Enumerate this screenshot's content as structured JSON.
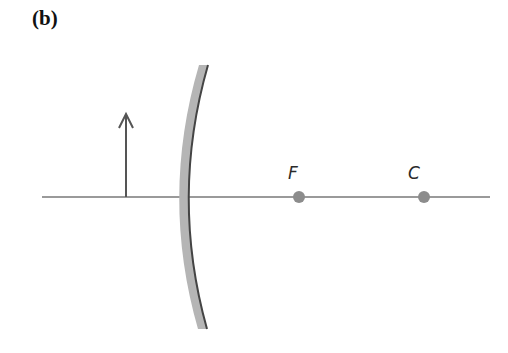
{
  "figure": {
    "panel_label": "(b)"
  },
  "diagram": {
    "principal_axis": {
      "x1": 42,
      "x2": 490,
      "y": 197,
      "color": "#9a9a9a"
    },
    "object": {
      "label": "object-arrow",
      "x": 126,
      "base_y": 197,
      "tip_y": 113,
      "color": "#555555"
    },
    "mirror": {
      "type": "convex",
      "fill": "#b5b5b5",
      "edge": "#444444"
    },
    "points": [
      {
        "label": "F",
        "x": 299,
        "y": 197,
        "label_x": 288,
        "label_y": 179
      },
      {
        "label": "C",
        "x": 424,
        "y": 197,
        "label_x": 408,
        "label_y": 179
      }
    ],
    "point_color": "#8c8c8c"
  }
}
